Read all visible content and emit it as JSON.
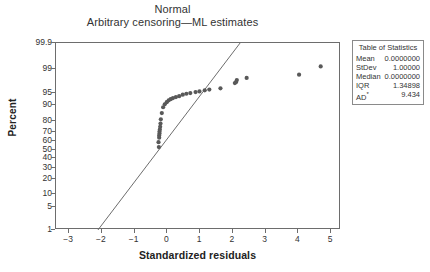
{
  "chart_data": {
    "type": "scatter",
    "title": "Normal",
    "subtitle": "Arbitrary censoring—ML estimates",
    "xlabel": "Standardized residuals",
    "ylabel": "Percent",
    "grid": false,
    "legend": "none",
    "xlim": [
      -3.4,
      5.3
    ],
    "ylim": [
      1,
      99.9
    ],
    "y_scale": "normal-probability",
    "x_ticks": [
      -3,
      -2,
      -1,
      0,
      1,
      2,
      3,
      4,
      5
    ],
    "x_tick_labels": [
      "−3",
      "−2",
      "−1",
      "0",
      "1",
      "2",
      "3",
      "4",
      "5"
    ],
    "y_ticks": [
      99.9,
      99,
      95,
      90,
      80,
      70,
      60,
      50,
      40,
      30,
      20,
      10,
      5,
      1
    ],
    "y_tick_labels": [
      "99.9",
      "99",
      "95",
      "90",
      "80",
      "70",
      "60",
      "50",
      "40",
      "30",
      "20",
      "10",
      "5",
      "1"
    ],
    "point_color": "#595959",
    "line_color": "#6d6d6d",
    "fit_line": {
      "x": [
        -2.12,
        2.22
      ],
      "y": [
        1,
        99.9
      ]
    },
    "points": [
      {
        "x": -0.26,
        "y": 53.0
      },
      {
        "x": -0.27,
        "y": 58.5
      },
      {
        "x": -0.25,
        "y": 63.5
      },
      {
        "x": -0.25,
        "y": 66.0
      },
      {
        "x": -0.24,
        "y": 68.0
      },
      {
        "x": -0.24,
        "y": 70.0
      },
      {
        "x": -0.23,
        "y": 72.0
      },
      {
        "x": -0.22,
        "y": 74.5
      },
      {
        "x": -0.21,
        "y": 77.5
      },
      {
        "x": -0.2,
        "y": 81.0
      },
      {
        "x": -0.17,
        "y": 85.5
      },
      {
        "x": -0.13,
        "y": 89.0
      },
      {
        "x": -0.08,
        "y": 90.5
      },
      {
        "x": -0.02,
        "y": 91.5
      },
      {
        "x": 0.04,
        "y": 92.3
      },
      {
        "x": 0.1,
        "y": 92.8
      },
      {
        "x": 0.17,
        "y": 93.2
      },
      {
        "x": 0.26,
        "y": 93.6
      },
      {
        "x": 0.36,
        "y": 93.9
      },
      {
        "x": 0.47,
        "y": 94.4
      },
      {
        "x": 0.58,
        "y": 94.7
      },
      {
        "x": 0.7,
        "y": 94.9
      },
      {
        "x": 0.86,
        "y": 95.2
      },
      {
        "x": 0.98,
        "y": 95.4
      },
      {
        "x": 1.14,
        "y": 95.7
      },
      {
        "x": 1.28,
        "y": 95.9
      },
      {
        "x": 1.62,
        "y": 96.2
      },
      {
        "x": 2.06,
        "y": 97.3
      },
      {
        "x": 2.1,
        "y": 97.5
      },
      {
        "x": 2.12,
        "y": 97.8
      },
      {
        "x": 2.42,
        "y": 98.1
      },
      {
        "x": 4.02,
        "y": 98.5
      },
      {
        "x": 4.68,
        "y": 99.2
      }
    ]
  },
  "stats_table": {
    "heading": "Table of Statistics",
    "rows": [
      {
        "label": "Mean",
        "value": "0.0000000"
      },
      {
        "label": "StDev",
        "value": "1.00000"
      },
      {
        "label": "Median",
        "value": "0.0000000"
      },
      {
        "label": "IQR",
        "value": "1.34898"
      },
      {
        "label": "AD",
        "label_sup": "*",
        "value": "9.434"
      }
    ]
  }
}
